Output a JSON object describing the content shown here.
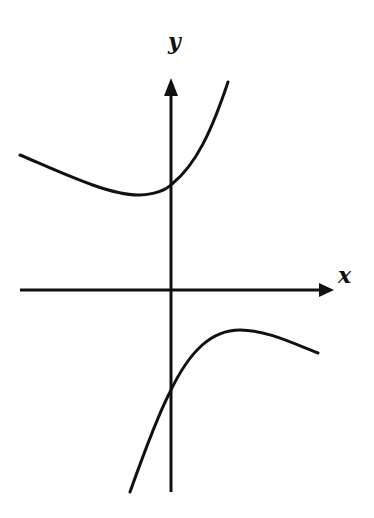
{
  "diagram": {
    "type": "function-graph",
    "axes": {
      "x_label": "x",
      "y_label": "y",
      "color": "#111111",
      "origin_px": [
        170,
        290
      ]
    },
    "curves": [
      {
        "name": "upper-branch",
        "shape": "concave up, minimum left of y-axis, crosses y-axis above origin, rises steeply to the right",
        "points_px": [
          [
            20,
            155
          ],
          [
            140,
            196
          ],
          [
            170,
            184
          ],
          [
            228,
            82
          ]
        ]
      },
      {
        "name": "lower-branch",
        "shape": "concave down, maximum right of y-axis, crosses y-axis below origin, falls steeply to the left",
        "points_px": [
          [
            130,
            492
          ],
          [
            170,
            392
          ],
          [
            240,
            330
          ],
          [
            318,
            353
          ]
        ]
      }
    ],
    "stroke_color": "#111111"
  }
}
